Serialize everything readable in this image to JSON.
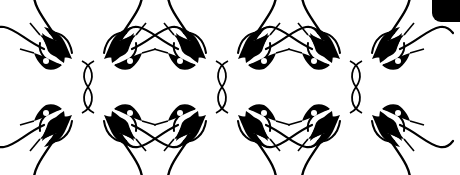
{
  "image": {
    "description": "Decorative tribal/gothic ornament strip",
    "motif_count": 3,
    "motif_centers_x": [
      88,
      222,
      356
    ],
    "motif_center_y": 87,
    "colors": {
      "ink": "#000000",
      "background": "#ffffff"
    }
  },
  "corner_tab": {
    "label": ""
  },
  "motifs": [
    {
      "name": "ornament-motif-1"
    },
    {
      "name": "ornament-motif-2"
    },
    {
      "name": "ornament-motif-3"
    }
  ]
}
